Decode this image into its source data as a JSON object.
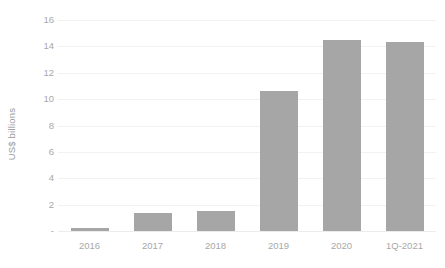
{
  "chart_data": {
    "type": "bar",
    "title": "",
    "xlabel": "",
    "ylabel": "US$ billions",
    "categories": [
      "2016",
      "2017",
      "2018",
      "2019",
      "2020",
      "1Q-2021"
    ],
    "values": [
      0.2,
      1.35,
      1.5,
      10.6,
      14.45,
      14.35
    ],
    "ylim": [
      0,
      16
    ],
    "ytick_values": [
      0,
      2,
      4,
      6,
      8,
      10,
      12,
      14,
      16
    ],
    "ytick_labels": [
      "-",
      "2",
      "4",
      "6",
      "8",
      "10",
      "12",
      "14",
      "16"
    ],
    "grid": true,
    "legend": false,
    "legend_position": "none",
    "series": [
      {
        "name": "US$ billions",
        "color": "#A6A6A6",
        "values": [
          0.2,
          1.35,
          1.5,
          10.6,
          14.45,
          14.35
        ]
      }
    ],
    "colors": {
      "bar": "#A6A6A6",
      "gridline": "#F2F2F2",
      "tick_label": "#A8A8A8",
      "axis_title": "#9A9A9A",
      "background": "#FFFFFF"
    }
  }
}
